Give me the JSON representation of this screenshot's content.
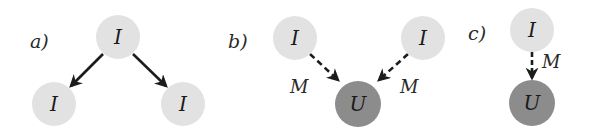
{
  "colors": {
    "observed_node": "#e2e2e2",
    "unobserved_node": "#8c8c8c",
    "edge": "#1c1c1c",
    "background": "#ffffff"
  },
  "panels": [
    {
      "id": "a",
      "label": "a)",
      "nodes": [
        {
          "id": "a-top",
          "text": "I",
          "type": "observed"
        },
        {
          "id": "a-left",
          "text": "I",
          "type": "observed"
        },
        {
          "id": "a-right",
          "text": "I",
          "type": "observed"
        }
      ],
      "edges": [
        {
          "from": "a-top",
          "to": "a-left",
          "style": "solid",
          "label": ""
        },
        {
          "from": "a-top",
          "to": "a-right",
          "style": "solid",
          "label": ""
        }
      ]
    },
    {
      "id": "b",
      "label": "b)",
      "nodes": [
        {
          "id": "b-left",
          "text": "I",
          "type": "observed"
        },
        {
          "id": "b-right",
          "text": "I",
          "type": "observed"
        },
        {
          "id": "b-bottom",
          "text": "U",
          "type": "unobserved"
        }
      ],
      "edges": [
        {
          "from": "b-left",
          "to": "b-bottom",
          "style": "dashed",
          "label": "M"
        },
        {
          "from": "b-right",
          "to": "b-bottom",
          "style": "dashed",
          "label": "M"
        }
      ]
    },
    {
      "id": "c",
      "label": "c)",
      "nodes": [
        {
          "id": "c-top",
          "text": "I",
          "type": "observed"
        },
        {
          "id": "c-bottom",
          "text": "U",
          "type": "unobserved"
        }
      ],
      "edges": [
        {
          "from": "c-top",
          "to": "c-bottom",
          "style": "dashed",
          "label": "M"
        }
      ]
    }
  ]
}
